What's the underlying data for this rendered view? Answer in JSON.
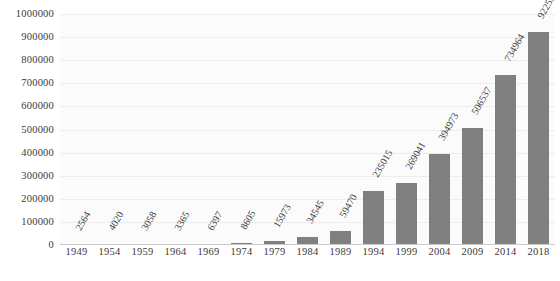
{
  "chart_data": {
    "type": "bar",
    "title": "",
    "subtitle": "",
    "xlabel": "",
    "ylabel": "",
    "categories": [
      "1949",
      "1954",
      "1959",
      "1964",
      "1969",
      "1974",
      "1979",
      "1984",
      "1989",
      "1994",
      "1999",
      "2004",
      "2009",
      "2014",
      "2018"
    ],
    "values": [
      2564,
      4020,
      3058,
      3365,
      6397,
      8605,
      15973,
      34545,
      59470,
      235015,
      269041,
      394973,
      506537,
      734964,
      922555
    ],
    "value_labels": [
      "2564",
      "4020",
      "3058",
      "3365",
      "6397",
      "8605",
      "15973",
      "34545",
      "59470",
      "235015",
      "269041",
      "394973",
      "506537",
      "734964",
      "922555"
    ],
    "ylim": [
      0,
      1000000
    ],
    "ytick_values": [
      0,
      100000,
      200000,
      300000,
      400000,
      500000,
      600000,
      700000,
      800000,
      900000,
      1000000
    ],
    "ytick_labels": [
      "0",
      "100000",
      "200000",
      "300000",
      "400000",
      "500000",
      "600000",
      "700000",
      "800000",
      "900000",
      "1000000"
    ],
    "grid": true,
    "legend": false,
    "legend_position": "none",
    "bar_color": "#808080",
    "plot_background": "#fbfbfb",
    "gridline_color": "#ededed",
    "axis_color": "#c9c9c9",
    "text_color": "#3b3b3b",
    "data_label_rotation": -60
  }
}
